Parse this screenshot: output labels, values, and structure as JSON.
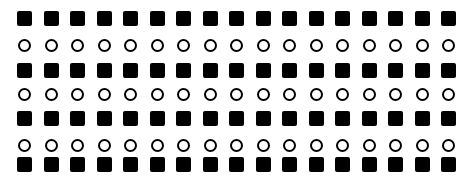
{
  "pattern": {
    "columns": 17,
    "column_x": [
      17,
      44,
      70,
      97,
      123,
      150,
      176,
      203,
      229,
      256,
      282,
      309,
      335,
      362,
      388,
      415,
      441
    ],
    "rows": [
      {
        "shape": "square",
        "y": 11
      },
      {
        "shape": "circle",
        "y": 39
      },
      {
        "shape": "square",
        "y": 63
      },
      {
        "shape": "circle",
        "y": 88
      },
      {
        "shape": "square",
        "y": 111
      },
      {
        "shape": "circle",
        "y": 139
      },
      {
        "shape": "square",
        "y": 157
      }
    ],
    "colors": {
      "fill": "#000000",
      "background": "#ffffff"
    }
  }
}
